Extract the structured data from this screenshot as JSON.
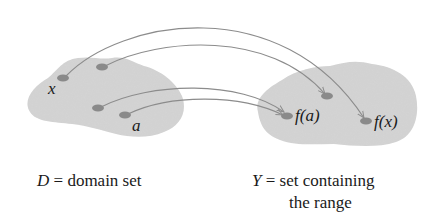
{
  "diagram": {
    "type": "function-mapping",
    "domain_set": {
      "name": "D",
      "caption_symbol": "D",
      "caption_eq": " = ",
      "caption_text": "domain set",
      "points": [
        {
          "id": "x",
          "label": "x"
        },
        {
          "id": "p2",
          "label": ""
        },
        {
          "id": "p3",
          "label": ""
        },
        {
          "id": "a",
          "label": "a"
        }
      ]
    },
    "codomain_set": {
      "name": "Y",
      "caption_symbol": "Y",
      "caption_eq": " = ",
      "caption_line1": "set containing",
      "caption_line2": "the range",
      "points": [
        {
          "id": "q1",
          "label": ""
        },
        {
          "id": "fa",
          "label": "f(a)"
        },
        {
          "id": "fx",
          "label": "f(x)"
        }
      ]
    },
    "mappings": [
      {
        "from": "x",
        "to": "fx"
      },
      {
        "from": "p2",
        "to": "q1"
      },
      {
        "from": "p3",
        "to": "fa"
      },
      {
        "from": "a",
        "to": "fa"
      }
    ],
    "colors": {
      "blob": "#d4d4d4",
      "dot": "#8a8a8a",
      "arrow": "#8c8c8c",
      "text": "#1a1a1a"
    }
  }
}
